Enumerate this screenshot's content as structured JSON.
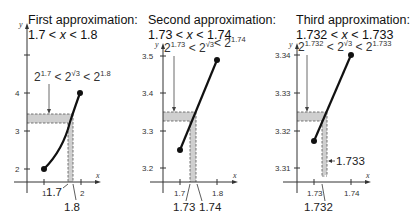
{
  "panels": [
    {
      "title_line1": "First approximation:",
      "title_line2": {
        "left": "1.7 <",
        "var": "x",
        "right": "< 1.8"
      },
      "inequality": {
        "base": "2",
        "low_exp": "1.7",
        "mid_exp": "√3",
        "high_exp": "1.8",
        "op": "<"
      },
      "y_ticks": [
        "2",
        "3",
        "4"
      ],
      "x_ticks": [
        "1",
        "2"
      ],
      "x_callouts": [
        "1.7",
        "1.8"
      ],
      "axis_x": "x",
      "axis_y": "y"
    },
    {
      "title_line1": "Second approximation:",
      "title_line2": {
        "left": "1.73 <",
        "var": "x",
        "right": "< 1.74"
      },
      "inequality": {
        "base": "2",
        "low_exp": "1.73",
        "mid_exp": "√3",
        "high_exp": "1.74",
        "op": "<"
      },
      "y_ticks": [
        "3.2",
        "3.3",
        "3.4",
        "3.5"
      ],
      "x_ticks": [
        "1.7",
        "1.8"
      ],
      "x_callouts": [
        "1.73",
        "1.74"
      ],
      "axis_x": "x",
      "axis_y": "y"
    },
    {
      "title_line1": "Third approximation:",
      "title_line2": {
        "left": "1.732 <",
        "var": "x",
        "right": "< 1.733"
      },
      "inequality": {
        "base": "2",
        "low_exp": "1.732",
        "mid_exp": "√3",
        "high_exp": "1.733",
        "op": "<"
      },
      "y_ticks": [
        "3.31",
        "3.32",
        "3.33",
        "3.34"
      ],
      "x_ticks": [
        "1.73",
        "1.74"
      ],
      "x_callouts": [
        "1.732",
        "1.733"
      ],
      "axis_x": "x",
      "axis_y": "y"
    }
  ],
  "colors": {
    "curve": "#111111",
    "shade": "#cfcfcf",
    "dash": "#555555",
    "axis": "#333333"
  }
}
